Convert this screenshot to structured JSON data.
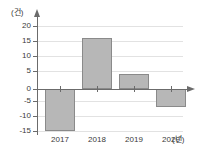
{
  "chart_data": {
    "type": "bar",
    "title": "",
    "subtitle": "",
    "xlabel": "(년)",
    "ylabel": "(건)",
    "categories": [
      "2017",
      "2018",
      "2019",
      "2020"
    ],
    "values": [
      -14,
      17,
      5,
      -6
    ],
    "series": [
      {
        "name": "",
        "values": [
          -14,
          17,
          5,
          -6
        ]
      }
    ],
    "ylim": [
      -15,
      20
    ],
    "ytick_labels": [
      "20",
      "15",
      "10",
      "5",
      "0",
      "-5",
      "-10",
      "-15"
    ],
    "ytick_values": [
      20,
      15,
      10,
      5,
      0,
      -5,
      -10,
      -15
    ],
    "xtick_labels": [
      "2017",
      "2018",
      "2019",
      "2020"
    ],
    "grid": true,
    "legend": false,
    "legend_position": "none",
    "annotations": [],
    "colors": {
      "bar_fill": "#b7b7b7",
      "bar_stroke": "#8a8a8a",
      "axis": "#6b6b6b",
      "gridline": "#e2e2e2",
      "text": "#3a3a3a",
      "background": "#ffffff"
    }
  }
}
